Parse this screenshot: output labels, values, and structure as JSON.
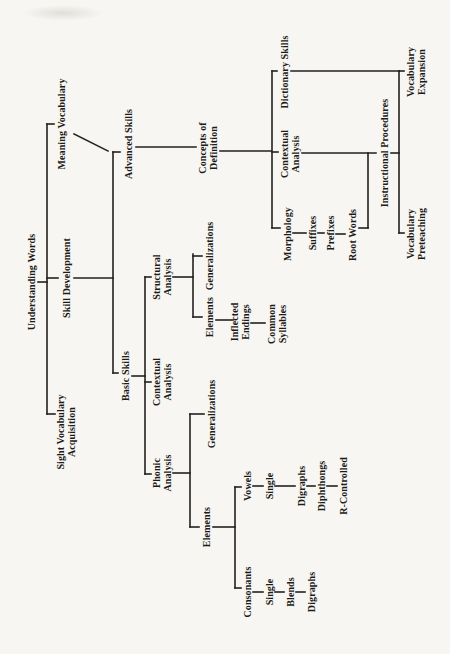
{
  "page": {
    "background": "#f7f6f2",
    "line_color": "#23211d",
    "text_color": "#1c1b18"
  },
  "diagram": {
    "type": "tree",
    "orientation": "landscape page rotated 90deg counterclockwise on portrait sheet",
    "root_label": "Understanding Words",
    "nodes": [
      {
        "id": "understanding-words",
        "label": "Understanding Words",
        "x": 372,
        "y": 31
      },
      {
        "id": "sight-vocabulary-acquisition",
        "label": "Sight Vocabulary\nAcquisition",
        "x": 222,
        "y": 66
      },
      {
        "id": "skill-development",
        "label": "Skill Development",
        "x": 376,
        "y": 66
      },
      {
        "id": "meaning-vocabulary",
        "label": "Meaning Vocabulary",
        "x": 530,
        "y": 61
      },
      {
        "id": "basic-skills",
        "label": "Basic Skills",
        "x": 278,
        "y": 125
      },
      {
        "id": "advanced-skills",
        "label": "Advanced Skills",
        "x": 510,
        "y": 128
      },
      {
        "id": "phonic-analysis",
        "label": "Phonic\nAnalysis",
        "x": 181,
        "y": 162
      },
      {
        "id": "contextual-analysis-basic",
        "label": "Contextual\nAnalysis",
        "x": 272,
        "y": 162
      },
      {
        "id": "structural-analysis",
        "label": "Structural\nAnalysis",
        "x": 377,
        "y": 162
      },
      {
        "id": "elements-phonic",
        "label": "Elements",
        "x": 127,
        "y": 206
      },
      {
        "id": "generalizations-phonic",
        "label": "Generalizations",
        "x": 240,
        "y": 211
      },
      {
        "id": "consonants",
        "label": "Consonants",
        "x": 62,
        "y": 247
      },
      {
        "id": "consonants-single",
        "label": "Single",
        "x": 62,
        "y": 269
      },
      {
        "id": "consonants-blends",
        "label": "Blends",
        "x": 62,
        "y": 290
      },
      {
        "id": "consonants-digraphs",
        "label": "Digraphs",
        "x": 62,
        "y": 311
      },
      {
        "id": "vowels",
        "label": "Vowels",
        "x": 168,
        "y": 247
      },
      {
        "id": "vowels-single",
        "label": "Single",
        "x": 168,
        "y": 269
      },
      {
        "id": "vowels-digraphs",
        "label": "Digraphs",
        "x": 168,
        "y": 301
      },
      {
        "id": "vowels-diphthongs",
        "label": "Diphthongs",
        "x": 168,
        "y": 321
      },
      {
        "id": "vowels-r-controlled",
        "label": "R-Controlled",
        "x": 168,
        "y": 343
      },
      {
        "id": "elements-structural",
        "label": "Elements",
        "x": 337,
        "y": 209
      },
      {
        "id": "inflected-endings",
        "label": "Inflected\nEndings",
        "x": 332,
        "y": 240
      },
      {
        "id": "common-syllables",
        "label": "Common\nSyllables",
        "x": 330,
        "y": 277
      },
      {
        "id": "generalizations-structural",
        "label": "Generalizations",
        "x": 398,
        "y": 209
      },
      {
        "id": "concepts-of-definition",
        "label": "Concepts of\nDefinition",
        "x": 506,
        "y": 208
      },
      {
        "id": "morphology",
        "label": "Morphology",
        "x": 420,
        "y": 287
      },
      {
        "id": "suffixes",
        "label": "Suffixes",
        "x": 421,
        "y": 312
      },
      {
        "id": "prefixes",
        "label": "Prefixes",
        "x": 421,
        "y": 330
      },
      {
        "id": "root-words",
        "label": "Root Words",
        "x": 419,
        "y": 352
      },
      {
        "id": "contextual-analysis-advanced",
        "label": "Contextual\nAnalysis",
        "x": 500,
        "y": 290
      },
      {
        "id": "dictionary-skills",
        "label": "Dictionary Skills",
        "x": 582,
        "y": 284
      },
      {
        "id": "instructional-procedures",
        "label": "Instructional Procedures",
        "x": 501,
        "y": 384
      },
      {
        "id": "vocabulary-preteaching",
        "label": "Vocabulary\nPreteaching",
        "x": 420,
        "y": 416
      },
      {
        "id": "vocabulary-expansion",
        "label": "Vocabulary\nExpansion",
        "x": 582,
        "y": 416
      }
    ],
    "connectors": [
      [
        372,
        38,
        372,
        47
      ],
      [
        240,
        47,
        530,
        47
      ],
      [
        240,
        47,
        240,
        55
      ],
      [
        376,
        47,
        376,
        58
      ],
      [
        376,
        74,
        376,
        113
      ],
      [
        530,
        47,
        530,
        54
      ],
      [
        520,
        74,
        503,
        108
      ],
      [
        281,
        113,
        502,
        113
      ],
      [
        281,
        113,
        281,
        118
      ],
      [
        278,
        132,
        278,
        145
      ],
      [
        502,
        113,
        502,
        120
      ],
      [
        507,
        136,
        507,
        196
      ],
      [
        180,
        145,
        377,
        145
      ],
      [
        180,
        145,
        180,
        151
      ],
      [
        272,
        145,
        272,
        151
      ],
      [
        377,
        145,
        377,
        151
      ],
      [
        181,
        173,
        181,
        190
      ],
      [
        127,
        190,
        240,
        190
      ],
      [
        127,
        190,
        127,
        199
      ],
      [
        240,
        190,
        240,
        204
      ],
      [
        127,
        213,
        127,
        235
      ],
      [
        66,
        235,
        167,
        235
      ],
      [
        66,
        235,
        66,
        241
      ],
      [
        167,
        235,
        167,
        241
      ],
      [
        62,
        253,
        62,
        263
      ],
      [
        62,
        275,
        62,
        284
      ],
      [
        62,
        296,
        62,
        305
      ],
      [
        168,
        253,
        168,
        263
      ],
      [
        168,
        275,
        168,
        295
      ],
      [
        168,
        307,
        168,
        315
      ],
      [
        168,
        327,
        168,
        337
      ],
      [
        377,
        173,
        377,
        193
      ],
      [
        337,
        193,
        400,
        193
      ],
      [
        337,
        193,
        337,
        202
      ],
      [
        398,
        193,
        398,
        202
      ],
      [
        334,
        216,
        334,
        233
      ],
      [
        331,
        251,
        331,
        265
      ],
      [
        503,
        220,
        503,
        271
      ],
      [
        426,
        272,
        583,
        272
      ],
      [
        426,
        272,
        426,
        280
      ],
      [
        421,
        293,
        421,
        306
      ],
      [
        421,
        318,
        421,
        324
      ],
      [
        420,
        336,
        420,
        345
      ],
      [
        426,
        359,
        426,
        368
      ],
      [
        426,
        368,
        501,
        368
      ],
      [
        502,
        272,
        502,
        278
      ],
      [
        501,
        302,
        501,
        376
      ],
      [
        583,
        272,
        583,
        277
      ],
      [
        583,
        291,
        583,
        399
      ],
      [
        501,
        391,
        501,
        399
      ],
      [
        421,
        399,
        583,
        399
      ],
      [
        421,
        399,
        421,
        404
      ],
      [
        583,
        399,
        583,
        404
      ]
    ]
  }
}
